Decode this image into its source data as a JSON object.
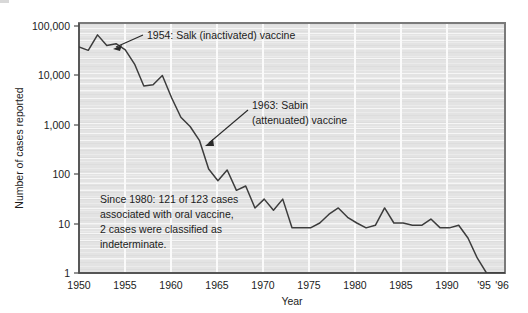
{
  "figure": {
    "background_color": "#ffffff",
    "plot_background_color": "#e2e2e2",
    "line_color": "#3c3c3c",
    "axis_color": "#555555",
    "gridline_color": "#f2f2f2",
    "text_color": "#1c1c1c"
  },
  "axes": {
    "x_label": "Year",
    "y_label": "Number of cases reported",
    "x_ticks": [
      "1950",
      "1955",
      "1960",
      "1965",
      "1970",
      "1975",
      "1980",
      "1985",
      "1990",
      "'95",
      "'96"
    ],
    "x_tick_values": [
      1950,
      1955,
      1960,
      1965,
      1970,
      1975,
      1980,
      1985,
      1990,
      1995,
      1996
    ],
    "y_ticks": [
      "1",
      "10",
      "100",
      "1,000",
      "10,000",
      "100,000"
    ],
    "y_tick_values": [
      1,
      10,
      100,
      1000,
      10000,
      100000
    ],
    "y_scale": "log",
    "x_range": [
      1950,
      1996
    ],
    "y_range": [
      1,
      100000
    ]
  },
  "annotations": [
    {
      "id": "salk",
      "lines": [
        "1954: Salk (inactivated) vaccine"
      ],
      "target_year": 1954,
      "target_value": 38000
    },
    {
      "id": "sabin",
      "lines": [
        "1963: Sabin",
        "(attenuated) vaccine"
      ],
      "target_year": 1963,
      "target_value": 450
    }
  ],
  "note": {
    "lines": [
      "Since 1980: 121 of 123 cases",
      "associated with oral vaccine,",
      "2 cases were classified as",
      "indeterminate."
    ]
  },
  "chart_data": {
    "type": "line",
    "title": "",
    "subtitle": "",
    "xlabel": "Year",
    "ylabel": "Number of cases reported",
    "yscale": "log",
    "ylim": [
      1,
      100000
    ],
    "xlim": [
      1950,
      1996
    ],
    "grid": true,
    "legend": "none",
    "series": [
      {
        "name": "Poliomyelitis cases reported",
        "x": [
          1950,
          1951,
          1952,
          1953,
          1954,
          1955,
          1956,
          1957,
          1958,
          1959,
          1960,
          1961,
          1962,
          1963,
          1964,
          1965,
          1966,
          1967,
          1968,
          1969,
          1970,
          1971,
          1972,
          1973,
          1974,
          1975,
          1976,
          1977,
          1978,
          1979,
          1980,
          1981,
          1982,
          1983,
          1984,
          1985,
          1986,
          1987,
          1988,
          1989,
          1990,
          1991,
          1992,
          1993,
          1994,
          1995,
          1996
        ],
        "y": [
          33300,
          28400,
          57900,
          35600,
          38500,
          28900,
          15100,
          5500,
          5800,
          8900,
          3200,
          1300,
          850,
          450,
          120,
          70,
          115,
          45,
          55,
          20,
          30,
          18,
          30,
          8,
          8,
          8,
          10,
          15,
          20,
          13,
          10,
          8,
          9,
          20,
          10,
          10,
          9,
          9,
          12,
          8,
          8,
          9,
          5,
          2,
          1,
          1,
          1
        ]
      }
    ],
    "annotations": [
      {
        "text": "1954: Salk (inactivated) vaccine",
        "x": 1954,
        "y": 38000
      },
      {
        "text": "1963: Sabin (attenuated) vaccine",
        "x": 1963,
        "y": 450
      },
      {
        "text": "Since 1980: 121 of 123 cases associated with oral vaccine, 2 cases were classified as indeterminate.",
        "x": 1957,
        "y": 20
      }
    ]
  }
}
